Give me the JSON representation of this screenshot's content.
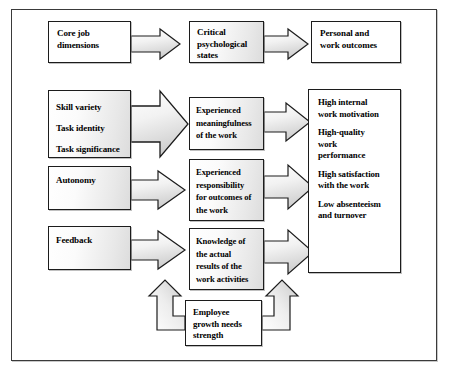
{
  "diagram": {
    "header_row": {
      "core_job_dimensions": "Core job\ndimensions",
      "critical_psychological_states": "Critical\npsychological\nstates",
      "personal_and_work_outcomes": "Personal and\nwork outcomes"
    },
    "core_dimensions_box": {
      "items": [
        "Skill variety",
        "Task identity",
        "Task significance"
      ]
    },
    "autonomy_box": {
      "label": "Autonomy"
    },
    "feedback_box": {
      "label": "Feedback"
    },
    "psychological_states": [
      {
        "name": "experienced-meaningfulness",
        "lines": [
          "Experienced",
          "meaningfulness",
          "of the work"
        ]
      },
      {
        "name": "experienced-responsibility",
        "lines": [
          "Experienced",
          "responsibility",
          "for outcomes of",
          "the work"
        ]
      },
      {
        "name": "knowledge-of-results",
        "lines": [
          "Knowledge of",
          "the actual",
          "results of the",
          "work activities"
        ]
      }
    ],
    "outcomes_box": {
      "items": [
        [
          "High internal",
          "work motivation"
        ],
        [
          "High-quality",
          "work",
          "performance"
        ],
        [
          "High satisfaction",
          "with the work"
        ],
        [
          "Low absenteeism",
          "and turnover"
        ]
      ]
    },
    "moderator_box": {
      "lines": [
        "Employee",
        "growth needs",
        "strength"
      ]
    },
    "colors": {
      "border": "#1c1c1c",
      "frame": "#3a3a3a",
      "box_fill_light": "#ffffff",
      "box_fill_dark": "#dcdcdc",
      "arrow_fill_light": "#ffffff",
      "arrow_fill_dark": "#d2d2d2",
      "text": "#000000"
    }
  }
}
